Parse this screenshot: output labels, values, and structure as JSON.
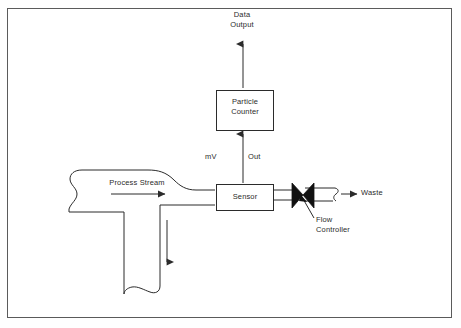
{
  "diagram": {
    "title_text": "Particle counter sampling schematic",
    "frame_color": "#5a5a5a",
    "line_color": "#2b2b2b",
    "background": "#ffffff",
    "labels": {
      "data_output": "Data\nOutput",
      "particle_counter": "Particle\nCounter",
      "mv": "mV",
      "out": "Out",
      "sensor": "Sensor",
      "process_stream": "Process Stream",
      "waste": "Waste",
      "flow_controller": "Flow\nController"
    },
    "nodes": [
      {
        "id": "particle-counter",
        "label": "Particle Counter",
        "shape": "rectangle"
      },
      {
        "id": "sensor",
        "label": "Sensor",
        "shape": "rectangle"
      },
      {
        "id": "flow-controller",
        "label": "Flow Controller",
        "shape": "valve-bowtie"
      }
    ],
    "flows": [
      {
        "id": "signal-sensor-to-counter",
        "from": "sensor",
        "to": "particle-counter",
        "label": "mV / Out",
        "direction": "up"
      },
      {
        "id": "counter-to-data-output",
        "from": "particle-counter",
        "to": "data-output",
        "label": "Data Output",
        "direction": "up"
      },
      {
        "id": "process-stream-inlet",
        "from": "process-stream",
        "to": "sensor",
        "label": "Process Stream",
        "direction": "right"
      },
      {
        "id": "sensor-to-waste",
        "from": "sensor",
        "to": "waste",
        "label": "Waste",
        "direction": "right"
      },
      {
        "id": "process-stream-downcomer",
        "from": "process-stream",
        "to": "downstream",
        "label": "",
        "direction": "down"
      }
    ]
  }
}
